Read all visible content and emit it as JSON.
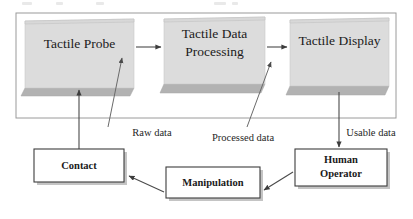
{
  "diagram": {
    "colors": {
      "block_fill": "#dcdcdc",
      "block_base": "#b2b2b2",
      "flat_fill": "#ffffff",
      "stroke": "#3d3d3d",
      "frame": "#9a9a9a",
      "text": "#1a1a1a"
    },
    "system_blocks": [
      {
        "id": "tactile-probe",
        "label": "Tactile Probe",
        "lines": [
          "Tactile Probe"
        ]
      },
      {
        "id": "tactile-data-processing",
        "label": "Tactile Data Processing",
        "lines": [
          "Tactile Data",
          "Processing"
        ]
      },
      {
        "id": "tactile-display",
        "label": "Tactile Display",
        "lines": [
          "Tactile Display"
        ]
      }
    ],
    "human_blocks": [
      {
        "id": "contact",
        "label": "Contact",
        "lines": [
          "Contact"
        ]
      },
      {
        "id": "manipulation",
        "label": "Manipulation",
        "lines": [
          "Manipulation"
        ]
      },
      {
        "id": "human-operator",
        "label": "Human Operator",
        "lines": [
          "Human",
          "Operator"
        ]
      }
    ],
    "flow_labels": [
      {
        "id": "raw-data",
        "label": "Raw data"
      },
      {
        "id": "processed-data",
        "label": "Processed data"
      },
      {
        "id": "usable-data",
        "label": "Usable data"
      }
    ]
  }
}
